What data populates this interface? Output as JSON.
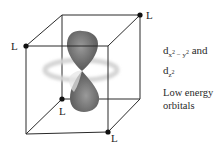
{
  "figure": {
    "ligand_label": "L",
    "ligands": [
      {
        "position": "front-top-left",
        "label": "L"
      },
      {
        "position": "back-top-right",
        "label": "L"
      },
      {
        "position": "back-bottom-left",
        "label": "L"
      },
      {
        "position": "front-bottom-right",
        "label": "L"
      }
    ],
    "orbitals": [
      {
        "name": "dz2",
        "description": "dumbbell lobes along vertical axis with torus ring"
      }
    ]
  },
  "caption": {
    "orbital_1_main": "d",
    "orbital_1_sub_a": "x",
    "orbital_1_sup_a": "2",
    "orbital_1_sub_mid": " − ",
    "orbital_1_sub_b": "y",
    "orbital_1_sup_b": "2",
    "conjunction": " and",
    "orbital_2_main": "d",
    "orbital_2_sub": "z",
    "orbital_2_sup": "2",
    "description_line1": "Low energy",
    "description_line2": "orbitals"
  },
  "colors": {
    "lobe_dark": "#6e6e6e",
    "lobe_light": "#a8a8a8",
    "ring": "#d9d9d9",
    "edge": "#2a2a2a"
  }
}
